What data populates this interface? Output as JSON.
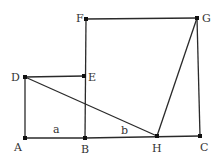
{
  "diagram": {
    "type": "geometry",
    "colors": {
      "line": "#2a2a2a",
      "point": "#111111",
      "label": "#333333",
      "background": "#ffffff"
    },
    "points": {
      "A": {
        "label": "A",
        "x": 25,
        "y": 138
      },
      "B": {
        "label": "B",
        "x": 85,
        "y": 138
      },
      "C": {
        "label": "C",
        "x": 200,
        "y": 136
      },
      "D": {
        "label": "D",
        "x": 25,
        "y": 77
      },
      "E": {
        "label": "E",
        "x": 84,
        "y": 76
      },
      "F": {
        "label": "F",
        "x": 86,
        "y": 19
      },
      "G": {
        "label": "G",
        "x": 197,
        "y": 18
      },
      "H": {
        "label": "H",
        "x": 157,
        "y": 136
      }
    },
    "segment_labels": {
      "a": "a",
      "b": "b"
    },
    "segments": [
      "AB",
      "BH",
      "HC",
      "AD",
      "DE",
      "EB",
      "BF",
      "FG",
      "GC",
      "DH",
      "HG"
    ]
  }
}
